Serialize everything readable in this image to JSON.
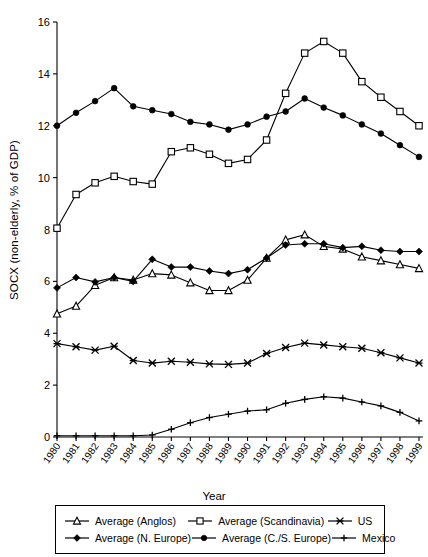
{
  "chart_data": {
    "type": "line",
    "title": "",
    "xlabel": "Year",
    "ylabel": "SOCX (non-elderly, % of GDP)",
    "xlim": [
      1980,
      1999
    ],
    "ylim": [
      0,
      16
    ],
    "ytick_step": 2,
    "grid": false,
    "legend_position": "bottom",
    "categories": [
      "1980",
      "1981",
      "1982",
      "1983",
      "1984",
      "1985",
      "1986",
      "1987",
      "1988",
      "1989",
      "1990",
      "1991",
      "1992",
      "1993",
      "1994",
      "1995",
      "1996",
      "1997",
      "1998",
      "1999"
    ],
    "yticks": [
      "0",
      "2",
      "4",
      "6",
      "8",
      "10",
      "12",
      "14",
      "16"
    ],
    "series": [
      {
        "name": "Average (Anglos)",
        "marker": "triangle-open",
        "values": [
          4.75,
          5.05,
          5.85,
          6.15,
          6.05,
          6.3,
          6.25,
          5.95,
          5.65,
          5.65,
          6.05,
          6.9,
          7.6,
          7.8,
          7.35,
          7.25,
          6.95,
          6.8,
          6.65,
          6.5
        ]
      },
      {
        "name": "Average (Scandinavia)",
        "marker": "square-open",
        "values": [
          8.05,
          9.35,
          9.8,
          10.05,
          9.85,
          9.75,
          11.0,
          11.15,
          10.9,
          10.55,
          10.7,
          11.45,
          13.25,
          14.8,
          15.25,
          14.8,
          13.7,
          13.1,
          12.55,
          12.0
        ]
      },
      {
        "name": "US",
        "marker": "star-x",
        "values": [
          3.6,
          3.48,
          3.35,
          3.5,
          2.95,
          2.85,
          2.92,
          2.88,
          2.82,
          2.8,
          2.85,
          3.22,
          3.45,
          3.62,
          3.55,
          3.48,
          3.42,
          3.25,
          3.05,
          2.85
        ]
      },
      {
        "name": "Average (N. Europe)",
        "marker": "diamond-filled",
        "values": [
          5.75,
          6.15,
          5.98,
          6.15,
          6.0,
          6.85,
          6.55,
          6.55,
          6.4,
          6.3,
          6.45,
          6.9,
          7.4,
          7.45,
          7.45,
          7.3,
          7.35,
          7.2,
          7.15,
          7.15
        ]
      },
      {
        "name": "Average (C./S. Europe)",
        "marker": "circle-filled",
        "values": [
          12.0,
          12.5,
          12.95,
          13.45,
          12.75,
          12.6,
          12.45,
          12.15,
          12.05,
          11.85,
          12.05,
          12.35,
          12.55,
          13.05,
          12.7,
          12.4,
          12.05,
          11.7,
          11.25,
          10.8
        ]
      },
      {
        "name": "Mexico",
        "marker": "plus",
        "values": [
          0.05,
          0.05,
          0.05,
          0.05,
          0.05,
          0.08,
          0.3,
          0.55,
          0.75,
          0.88,
          1.0,
          1.05,
          1.3,
          1.45,
          1.55,
          1.5,
          1.35,
          1.2,
          0.95,
          0.62
        ]
      }
    ]
  },
  "legend": {
    "rows": [
      [
        {
          "label": "Average (Anglos)",
          "marker": "triangle-open"
        },
        {
          "label": "Average (Scandinavia)",
          "marker": "square-open"
        },
        {
          "label": "US",
          "marker": "star-x"
        }
      ],
      [
        {
          "label": "Average (N. Europe)",
          "marker": "diamond-filled"
        },
        {
          "label": "Average (C./S. Europe)",
          "marker": "circle-filled"
        },
        {
          "label": "Mexico",
          "marker": "plus"
        }
      ]
    ]
  },
  "colors": {
    "line": "#000000",
    "axis": "#000000",
    "background": "#ffffff"
  }
}
